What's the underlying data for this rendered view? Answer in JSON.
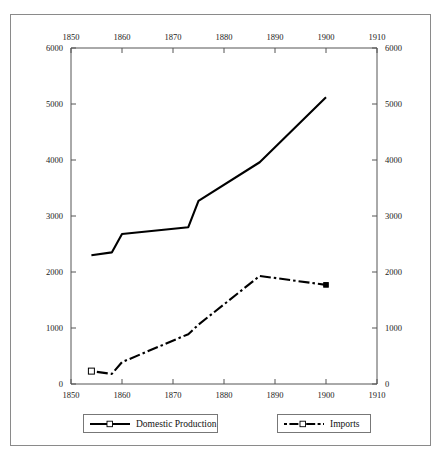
{
  "chart_data": {
    "type": "line",
    "title": "",
    "xlabel": "",
    "ylabel": "",
    "xlim": [
      1850,
      1910
    ],
    "ylim": [
      0,
      6000
    ],
    "grid": false,
    "legend_position": "bottom",
    "x_ticks_bottom": [
      "1850",
      "1860",
      "1870",
      "1880",
      "1890",
      "1900",
      "1910"
    ],
    "x_ticks_top": [
      "1850",
      "1860",
      "1870",
      "1880",
      "1890",
      "1900",
      "1910"
    ],
    "x_tick_values": [
      1850,
      1860,
      1870,
      1880,
      1890,
      1900,
      1910
    ],
    "y_ticks_left": [
      "0",
      "1000",
      "2000",
      "3000",
      "4000",
      "5000",
      "6000"
    ],
    "y_ticks_right": [
      "0",
      "1000",
      "2000",
      "3000",
      "4000",
      "5000",
      "6000"
    ],
    "y_tick_values": [
      0,
      1000,
      2000,
      3000,
      4000,
      5000,
      6000
    ],
    "series": [
      {
        "name": "Domestic Production",
        "style": "solid",
        "color": "#000000",
        "x": [
          1854,
          1858,
          1860,
          1873,
          1875,
          1887,
          1900
        ],
        "values": [
          2300,
          2350,
          2680,
          2800,
          3270,
          3960,
          5120
        ]
      },
      {
        "name": "Imports",
        "style": "dash-dot",
        "color": "#000000",
        "marker": "open-square",
        "x": [
          1854,
          1858,
          1860,
          1873,
          1875,
          1887,
          1900
        ],
        "values": [
          230,
          180,
          390,
          890,
          1060,
          1930,
          1770
        ]
      }
    ]
  },
  "legend": {
    "items": [
      {
        "label": "Domestic Production",
        "style": "solid"
      },
      {
        "label": "Imports",
        "style": "dash-dot"
      }
    ]
  },
  "axes": {
    "top_axis_name": "top-year-axis",
    "bottom_axis_name": "bottom-year-axis",
    "left_axis_name": "left-value-axis",
    "right_axis_name": "right-value-axis"
  }
}
